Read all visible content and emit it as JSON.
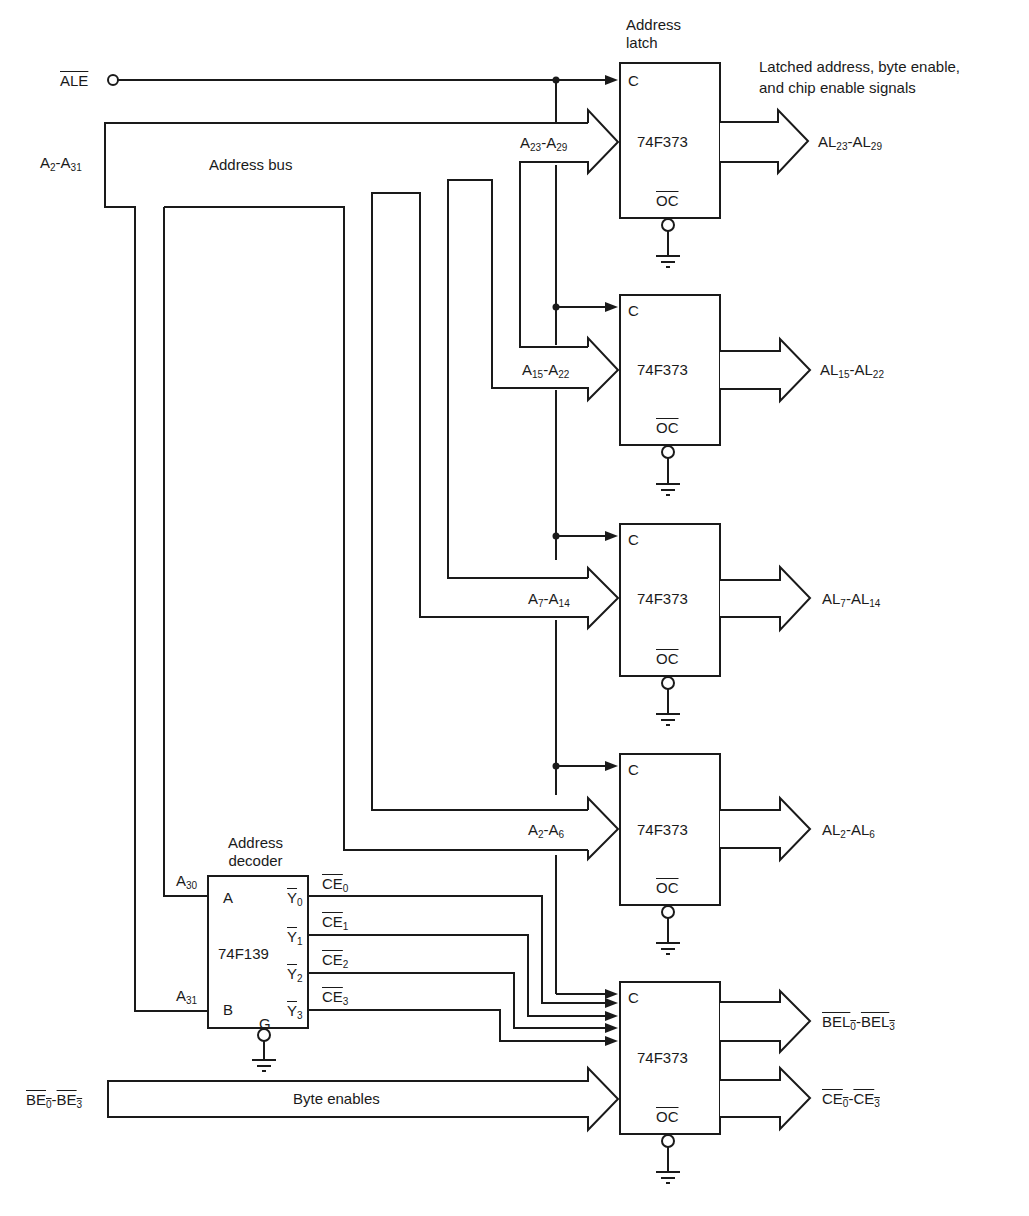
{
  "diagram": {
    "title_latch": "Address latch",
    "title_latch_line1": "Address",
    "title_latch_line2": "latch",
    "outputs_caption_line1": "Latched address, byte enable,",
    "outputs_caption_line2": "and chip enable signals",
    "inputs": {
      "ale": "ALE",
      "address_bus_label": "A2-A31",
      "address_bus_name": "Address bus",
      "byte_enables_label": "BE0-BE3",
      "byte_enables_name": "Byte enables"
    },
    "latches": [
      {
        "chip": "74F373",
        "clock": "C",
        "oc": "OC",
        "input": "A23-A29",
        "output": "AL23-AL29"
      },
      {
        "chip": "74F373",
        "clock": "C",
        "oc": "OC",
        "input": "A15-A22",
        "output": "AL15-AL22"
      },
      {
        "chip": "74F373",
        "clock": "C",
        "oc": "OC",
        "input": "A7-A14",
        "output": "AL7-AL14"
      },
      {
        "chip": "74F373",
        "clock": "C",
        "oc": "OC",
        "input": "A2-A6",
        "output": "AL2-AL6"
      },
      {
        "chip": "74F373",
        "clock": "C",
        "oc": "OC",
        "input": "BE0-BE3",
        "outputs": [
          "BEL0-BEL3",
          "CE0-CE3"
        ]
      }
    ],
    "decoder": {
      "title_line1": "Address",
      "title_line2": "decoder",
      "chip": "74F139",
      "inputs": [
        {
          "pin": "A",
          "signal": "A30"
        },
        {
          "pin": "B",
          "signal": "A31"
        }
      ],
      "enable": "G",
      "outputs": [
        {
          "pin": "Y0",
          "signal": "CE0"
        },
        {
          "pin": "Y1",
          "signal": "CE1"
        },
        {
          "pin": "Y2",
          "signal": "CE2"
        },
        {
          "pin": "Y3",
          "signal": "CE3"
        }
      ]
    }
  }
}
